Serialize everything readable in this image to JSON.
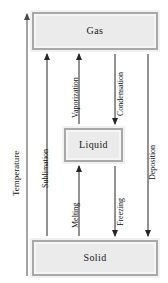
{
  "diagram": {
    "axis": {
      "label": "Temperature",
      "direction": "up",
      "color": "#4a4a4a"
    },
    "states": [
      {
        "id": "gas",
        "label": "Gas"
      },
      {
        "id": "liquid",
        "label": "Liquid"
      },
      {
        "id": "solid",
        "label": "Solid"
      }
    ],
    "transitions": [
      {
        "id": "sublimation",
        "label": "Sublimation",
        "from": "Solid",
        "to": "Gas",
        "direction": "up"
      },
      {
        "id": "vaporization",
        "label": "Vaporization",
        "from": "Liquid",
        "to": "Gas",
        "direction": "up"
      },
      {
        "id": "condensation",
        "label": "Condensation",
        "from": "Gas",
        "to": "Liquid",
        "direction": "down"
      },
      {
        "id": "deposition",
        "label": "Deposition",
        "from": "Gas",
        "to": "Solid",
        "direction": "down"
      },
      {
        "id": "melting",
        "label": "Melting",
        "from": "Solid",
        "to": "Liquid",
        "direction": "up"
      },
      {
        "id": "freezing",
        "label": "Freezing",
        "from": "Liquid",
        "to": "Solid",
        "direction": "down"
      }
    ],
    "colors": {
      "box_fill": "#ebebeb",
      "box_border": "#a8a8a8",
      "arrow": "#262626",
      "text": "#111111",
      "background": "#ffffff"
    }
  }
}
